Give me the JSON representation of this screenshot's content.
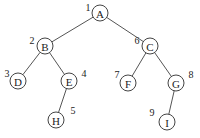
{
  "diagram": {
    "type": "binary-tree",
    "nodes": [
      {
        "id": "A",
        "label": "A",
        "order": "1",
        "x": 100,
        "y": 13,
        "nx": 88,
        "ny": 7
      },
      {
        "id": "B",
        "label": "B",
        "order": "2",
        "x": 45,
        "y": 46,
        "nx": 32,
        "ny": 40
      },
      {
        "id": "C",
        "label": "C",
        "order": "6",
        "x": 150,
        "y": 46,
        "nx": 137,
        "ny": 40
      },
      {
        "id": "D",
        "label": "D",
        "order": "3",
        "x": 18,
        "y": 81,
        "nx": 7,
        "ny": 73
      },
      {
        "id": "E",
        "label": "E",
        "order": "4",
        "x": 69,
        "y": 81,
        "nx": 84,
        "ny": 73
      },
      {
        "id": "F",
        "label": "F",
        "order": "7",
        "x": 128,
        "y": 83,
        "nx": 117,
        "ny": 74
      },
      {
        "id": "G",
        "label": "G",
        "order": "8",
        "x": 176,
        "y": 83,
        "nx": 191,
        "ny": 74
      },
      {
        "id": "H",
        "label": "H",
        "order": "5",
        "x": 56,
        "y": 120,
        "nx": 73,
        "ny": 110
      },
      {
        "id": "I",
        "label": "I",
        "order": "9",
        "x": 167,
        "y": 122,
        "nx": 152,
        "ny": 112
      }
    ],
    "edges": [
      {
        "from": "A",
        "to": "B"
      },
      {
        "from": "A",
        "to": "C"
      },
      {
        "from": "B",
        "to": "D"
      },
      {
        "from": "B",
        "to": "E"
      },
      {
        "from": "C",
        "to": "F"
      },
      {
        "from": "C",
        "to": "G"
      },
      {
        "from": "E",
        "to": "H"
      },
      {
        "from": "G",
        "to": "I"
      }
    ],
    "radius": 8
  }
}
